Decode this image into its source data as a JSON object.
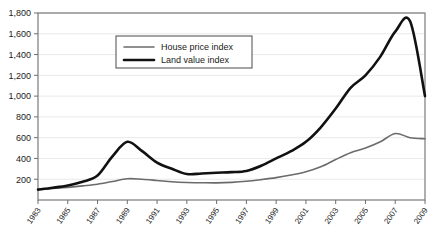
{
  "chart_data": {
    "type": "line",
    "title": "",
    "subtitle": "",
    "xlabel": "",
    "ylabel": "",
    "xlim": [
      1983,
      2009
    ],
    "ylim": [
      0,
      1800
    ],
    "grid": true,
    "legend_position": "top-left-inside",
    "y_ticks": [
      "200",
      "400",
      "600",
      "800",
      "1,000",
      "1,200",
      "1,400",
      "1,600",
      "1,800"
    ],
    "y_tick_values": [
      200,
      400,
      600,
      800,
      1000,
      1200,
      1400,
      1600,
      1800
    ],
    "x_ticks": [
      "1983",
      "1985",
      "1987",
      "1989",
      "1991",
      "1993",
      "1995",
      "1997",
      "1999",
      "2001",
      "2003",
      "2005",
      "2007",
      "2009"
    ],
    "x_tick_values": [
      1983,
      1985,
      1987,
      1989,
      1991,
      1993,
      1995,
      1997,
      1999,
      2001,
      2003,
      2005,
      2007,
      2009
    ],
    "x": [
      1983,
      1984,
      1985,
      1986,
      1987,
      1988,
      1989,
      1990,
      1991,
      1992,
      1993,
      1994,
      1995,
      1996,
      1997,
      1998,
      1999,
      2000,
      2001,
      2002,
      2003,
      2004,
      2005,
      2006,
      2007,
      2008,
      2009
    ],
    "series": [
      {
        "name": "House price index",
        "color": "#6b6b6b",
        "stroke_width": 1.6,
        "values": [
          100,
          110,
          122,
          136,
          152,
          178,
          205,
          200,
          188,
          175,
          168,
          166,
          165,
          170,
          180,
          196,
          215,
          240,
          272,
          320,
          390,
          455,
          500,
          560,
          640,
          600,
          590
        ]
      },
      {
        "name": "Land value index",
        "color": "#111111",
        "stroke_width": 2.6,
        "values": [
          100,
          118,
          140,
          175,
          235,
          420,
          560,
          470,
          360,
          300,
          250,
          255,
          262,
          268,
          280,
          330,
          400,
          470,
          560,
          700,
          880,
          1080,
          1200,
          1380,
          1620,
          1720,
          1000
        ]
      }
    ],
    "legend": [
      {
        "label": "House price index",
        "color": "#6b6b6b",
        "stroke_width": 1.6
      },
      {
        "label": "Land value index",
        "color": "#111111",
        "stroke_width": 2.6
      }
    ]
  }
}
